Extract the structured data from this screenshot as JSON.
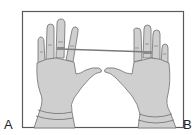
{
  "figure": {
    "panel_labels": {
      "left": "A",
      "right": "B"
    },
    "colors": {
      "frame": "#5a5a5a",
      "glove_fill": "#cfcfcf",
      "glove_outline": "#6e6e6e",
      "band": "#7a7a7a",
      "background": "#ffffff"
    }
  }
}
